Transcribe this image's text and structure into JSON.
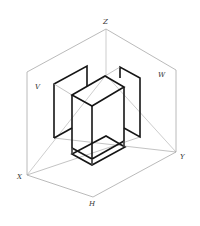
{
  "diagram": {
    "type": "isometric three-plane projection",
    "labels": {
      "z": "Z",
      "v": "V",
      "w": "W",
      "x": "X",
      "y": "Y",
      "h": "H"
    },
    "colors": {
      "frame": "#a8a8a8",
      "object": "#151515",
      "background": "#ffffff"
    }
  }
}
